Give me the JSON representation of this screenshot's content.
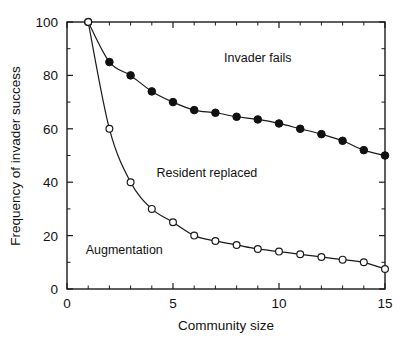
{
  "chart_data": {
    "type": "line",
    "title": "",
    "xlabel": "Community size",
    "ylabel": "Frequency of invader success",
    "xlim": [
      0,
      15
    ],
    "ylim": [
      0,
      100
    ],
    "xticks": [
      0,
      5,
      10,
      15
    ],
    "xtick_labels": [
      "0",
      "5",
      "10",
      "15"
    ],
    "yticks": [
      0,
      20,
      40,
      60,
      80,
      100
    ],
    "ytick_labels": [
      "0",
      "20",
      "40",
      "60",
      "80",
      "100"
    ],
    "x_minor_ticks": [
      1,
      2,
      3,
      4,
      6,
      7,
      8,
      9,
      11,
      12,
      13,
      14
    ],
    "y_minor_ticks": [
      10,
      30,
      50,
      70,
      90
    ],
    "grid": false,
    "legend_position": "none",
    "x": [
      1,
      2,
      3,
      4,
      5,
      6,
      7,
      8,
      9,
      10,
      11,
      12,
      13,
      14,
      15
    ],
    "series": [
      {
        "name": "Invader fails boundary",
        "marker": "filled-circle",
        "values": [
          100,
          85,
          80,
          74,
          70,
          67,
          66,
          64.5,
          63.5,
          62,
          60,
          58,
          55.5,
          52,
          50
        ]
      },
      {
        "name": "Augmentation boundary",
        "marker": "open-circle",
        "values": [
          100,
          60,
          40,
          30,
          25,
          20,
          18,
          16.5,
          15,
          14,
          13,
          12,
          11,
          10,
          7.5
        ]
      }
    ],
    "annotations": [
      {
        "text": "Invader fails",
        "x": 9.0,
        "y": 85
      },
      {
        "text": "Resident replaced",
        "x": 6.6,
        "y": 42
      },
      {
        "text": "Augmentation",
        "x": 2.7,
        "y": 13
      }
    ]
  }
}
